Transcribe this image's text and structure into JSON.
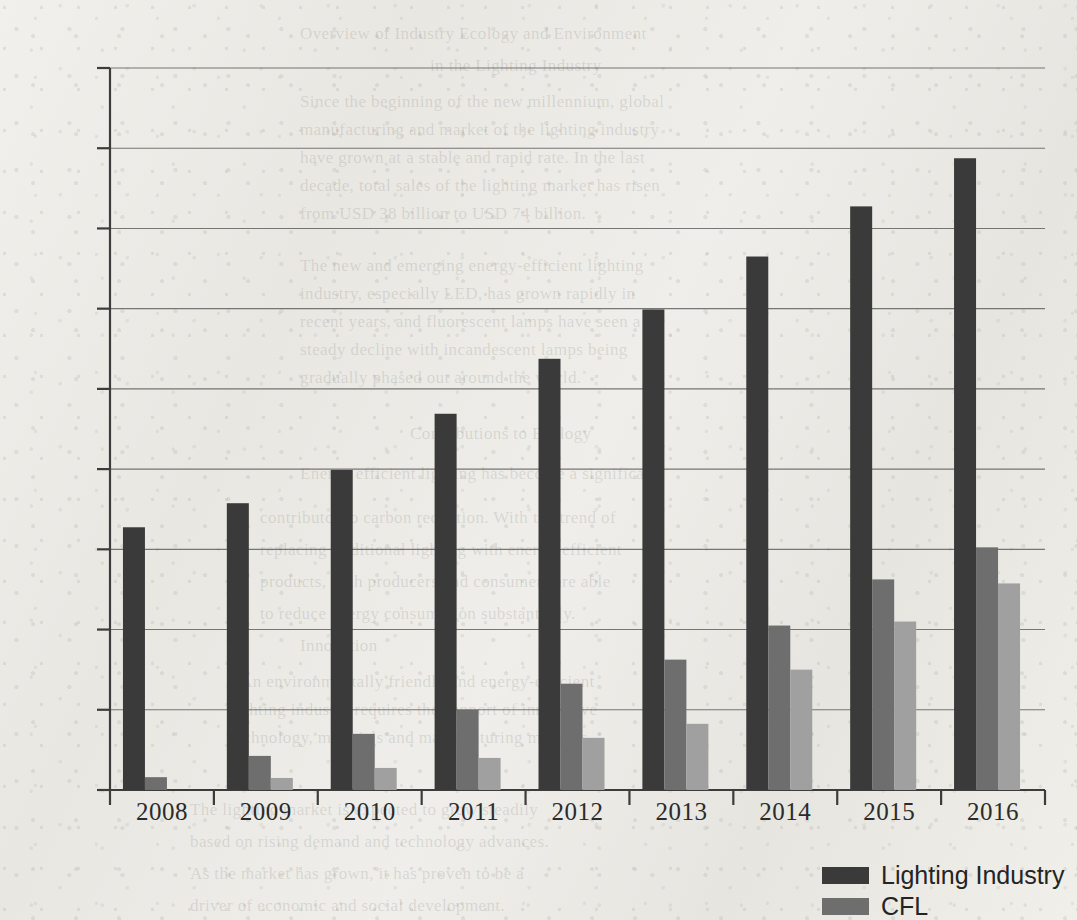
{
  "chart_data": {
    "type": "bar",
    "title": "",
    "xlabel": "",
    "ylabel": "",
    "ylim": [
      0,
      18000
    ],
    "ytick_step": 2000,
    "yticks": [
      "0",
      "2000",
      "4000",
      "6000",
      "8000",
      "10000",
      "12000",
      "14000",
      "16000",
      "18000"
    ],
    "categories": [
      "2008",
      "2009",
      "2010",
      "2011",
      "2012",
      "2013",
      "2014",
      "2015",
      "2016"
    ],
    "grid": true,
    "legend_position": "bottom-right",
    "series": [
      {
        "name": "Lighting Industry",
        "color": "#3a3a3a",
        "values": [
          6550,
          7150,
          7980,
          9380,
          10750,
          11980,
          13300,
          14550,
          15750
        ]
      },
      {
        "name": "CFL",
        "color": "#6e6e6e",
        "values": [
          320,
          850,
          1400,
          2000,
          2650,
          3250,
          4100,
          5250,
          6050
        ]
      },
      {
        "name": "",
        "color": "#a0a0a0",
        "values": [
          0,
          300,
          550,
          800,
          1300,
          1650,
          3000,
          4200,
          5150
        ]
      }
    ]
  },
  "legend": {
    "entries": [
      {
        "label": "Lighting Industry",
        "color": "#3a3a3a"
      },
      {
        "label": "CFL",
        "color": "#6e6e6e"
      }
    ]
  },
  "background_text": [
    {
      "text": "Overview of Industry Ecology and Environment",
      "x": 300,
      "y": 24,
      "size": 17
    },
    {
      "text": "in the Lighting Industry",
      "x": 430,
      "y": 56,
      "size": 17
    },
    {
      "text": "Since the beginning of the new millennium, global",
      "x": 300,
      "y": 92,
      "size": 17
    },
    {
      "text": "manufacturing and market of the lighting industry",
      "x": 300,
      "y": 120,
      "size": 17
    },
    {
      "text": "have grown at a stable and rapid rate. In the last",
      "x": 300,
      "y": 148,
      "size": 17
    },
    {
      "text": "decade, total sales of the lighting market has risen",
      "x": 300,
      "y": 176,
      "size": 17
    },
    {
      "text": "from USD 38 billion to USD 74 billion.",
      "x": 300,
      "y": 204,
      "size": 17
    },
    {
      "text": "The new and emerging energy-efficient lighting",
      "x": 300,
      "y": 256,
      "size": 17
    },
    {
      "text": "industry, especially LED, has grown rapidly in",
      "x": 300,
      "y": 284,
      "size": 17
    },
    {
      "text": "recent years, and fluorescent lamps have seen a",
      "x": 300,
      "y": 312,
      "size": 17
    },
    {
      "text": "steady decline with incandescent lamps being",
      "x": 300,
      "y": 340,
      "size": 17
    },
    {
      "text": "gradually phased out around the world.",
      "x": 300,
      "y": 368,
      "size": 17
    },
    {
      "text": "Contributions to Ecology",
      "x": 410,
      "y": 424,
      "size": 17
    },
    {
      "text": "Energy efficient lighting has become a significant",
      "x": 300,
      "y": 464,
      "size": 17
    },
    {
      "text": "contributor to carbon reduction. With the trend of",
      "x": 260,
      "y": 508,
      "size": 17
    },
    {
      "text": "replacing traditional lighting with energy-efficient",
      "x": 260,
      "y": 540,
      "size": 17
    },
    {
      "text": "products, both producers and consumers are able",
      "x": 260,
      "y": 572,
      "size": 17
    },
    {
      "text": "to reduce energy consumption substantially.",
      "x": 260,
      "y": 604,
      "size": 17
    },
    {
      "text": "Innovation",
      "x": 300,
      "y": 636,
      "size": 17
    },
    {
      "text": "An environmentally friendly and energy-efficient",
      "x": 240,
      "y": 672,
      "size": 17
    },
    {
      "text": "lighting industry requires the support of innovative",
      "x": 230,
      "y": 700,
      "size": 17
    },
    {
      "text": "technology, materials and manufacturing methods.",
      "x": 230,
      "y": 728,
      "size": 17
    },
    {
      "text": "The lighting market is expected to grow steadily",
      "x": 190,
      "y": 800,
      "size": 17
    },
    {
      "text": "based on rising demand and technology advances.",
      "x": 190,
      "y": 832,
      "size": 17
    },
    {
      "text": "As the market has grown, it has proven to be a",
      "x": 190,
      "y": 864,
      "size": 17
    },
    {
      "text": "driver of economic and social development.",
      "x": 190,
      "y": 896,
      "size": 17
    }
  ]
}
